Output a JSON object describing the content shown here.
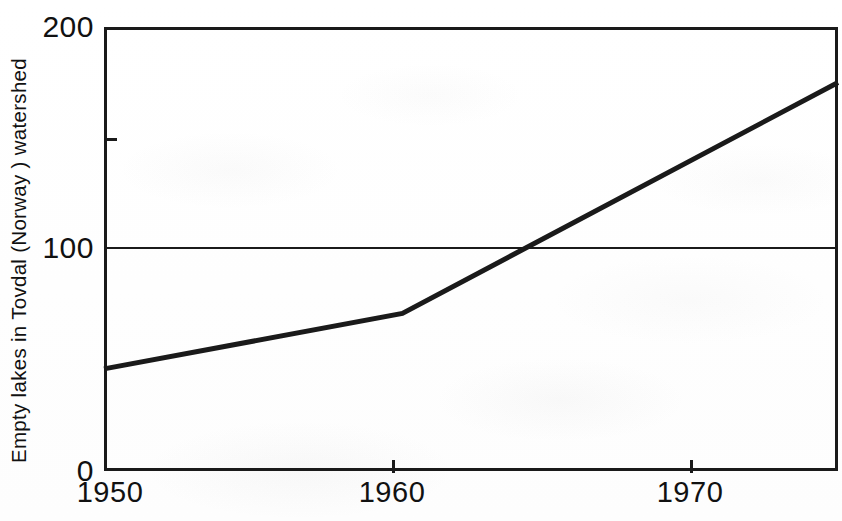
{
  "chart_data": {
    "type": "line",
    "title": "",
    "subtitle": "",
    "xlabel": "",
    "ylabel": "Empty lakes in Tovdal (Norway ) watershed",
    "xlim": [
      1950,
      1974.6
    ],
    "ylim": [
      0,
      200
    ],
    "grid": "single horizontal rule at y = 100",
    "legend": "none",
    "x_ticks": [
      {
        "value": 1950,
        "label": "1950"
      },
      {
        "value": 1960,
        "label": "1960"
      },
      {
        "value": 1970,
        "label": "1970"
      }
    ],
    "y_ticks": [
      {
        "value": 200,
        "label": "200"
      },
      {
        "value": 150,
        "label": ""
      },
      {
        "value": 100,
        "label": "100"
      },
      {
        "value": 0,
        "label": "0"
      }
    ],
    "series": [
      {
        "name": "Empty lakes",
        "x": [
          1950,
          1960,
          1974.6
        ],
        "values": [
          46,
          71,
          175
        ],
        "color": "#1a1a1a",
        "line_width": 5
      }
    ],
    "annotations": [
      {
        "text": "line crosses 100 at approximately 1963"
      }
    ]
  },
  "axes": {
    "y_title": "Empty lakes in Tovdal (Norway ) watershed",
    "y_tick_labels": {
      "t200": "200",
      "t150": "",
      "t100": "100",
      "t0": "0"
    },
    "x_tick_labels": {
      "t1950": "1950",
      "t1960": "1960",
      "t1970": "1970"
    }
  },
  "colors": {
    "ink": "#1a1a1a",
    "paper": "#ffffff",
    "series": "#1a1a1a"
  }
}
